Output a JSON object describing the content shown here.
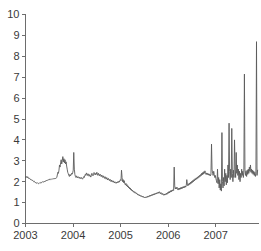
{
  "chart_data": {
    "type": "line",
    "title": "",
    "subtitle": "",
    "xlabel": "",
    "ylabel": "",
    "xlim": [
      2003.0,
      2007.9
    ],
    "ylim": [
      0,
      10
    ],
    "grid": false,
    "legend": null,
    "legend_position": "none",
    "line_color": "#5a5a5a",
    "axis_color": "#6d6d6d",
    "text_color": "#3a3a3a",
    "background": "#ffffff",
    "x_ticks": [
      2003,
      2004,
      2005,
      2006,
      2007
    ],
    "x_tick_labels": [
      "2003",
      "2004",
      "2005",
      "2006",
      "2007"
    ],
    "y_ticks": [
      0,
      1,
      2,
      3,
      4,
      5,
      6,
      7,
      8,
      9,
      10
    ],
    "y_tick_labels": [
      "0",
      "1",
      "2",
      "3",
      "4",
      "5",
      "6",
      "7",
      "8",
      "9",
      "10"
    ],
    "series": [
      {
        "name": "spread",
        "x": [
          2003.0,
          2003.012,
          2003.023,
          2003.035,
          2003.046,
          2003.058,
          2003.069,
          2003.081,
          2003.092,
          2003.104,
          2003.115,
          2003.127,
          2003.138,
          2003.15,
          2003.162,
          2003.173,
          2003.185,
          2003.196,
          2003.208,
          2003.219,
          2003.231,
          2003.242,
          2003.254,
          2003.265,
          2003.277,
          2003.288,
          2003.3,
          2003.312,
          2003.323,
          2003.335,
          2003.346,
          2003.358,
          2003.369,
          2003.381,
          2003.392,
          2003.404,
          2003.415,
          2003.427,
          2003.438,
          2003.45,
          2003.462,
          2003.473,
          2003.485,
          2003.496,
          2003.508,
          2003.519,
          2003.531,
          2003.542,
          2003.554,
          2003.565,
          2003.577,
          2003.588,
          2003.6,
          2003.612,
          2003.623,
          2003.635,
          2003.646,
          2003.658,
          2003.669,
          2003.681,
          2003.692,
          2003.704,
          2003.715,
          2003.727,
          2003.738,
          2003.75,
          2003.762,
          2003.773,
          2003.785,
          2003.796,
          2003.808,
          2003.819,
          2003.831,
          2003.842,
          2003.854,
          2003.865,
          2003.877,
          2003.888,
          2003.9,
          2003.912,
          2003.923,
          2003.935,
          2003.946,
          2003.958,
          2003.969,
          2003.981,
          2003.992,
          2004.004,
          2004.015,
          2004.027,
          2004.038,
          2004.05,
          2004.062,
          2004.073,
          2004.085,
          2004.096,
          2004.108,
          2004.119,
          2004.131,
          2004.142,
          2004.154,
          2004.165,
          2004.177,
          2004.188,
          2004.2,
          2004.212,
          2004.223,
          2004.235,
          2004.246,
          2004.258,
          2004.269,
          2004.281,
          2004.292,
          2004.304,
          2004.315,
          2004.327,
          2004.338,
          2004.35,
          2004.362,
          2004.373,
          2004.385,
          2004.396,
          2004.408,
          2004.419,
          2004.431,
          2004.442,
          2004.454,
          2004.465,
          2004.477,
          2004.488,
          2004.5,
          2004.512,
          2004.523,
          2004.535,
          2004.546,
          2004.558,
          2004.569,
          2004.581,
          2004.592,
          2004.604,
          2004.615,
          2004.627,
          2004.638,
          2004.65,
          2004.662,
          2004.673,
          2004.685,
          2004.696,
          2004.708,
          2004.719,
          2004.731,
          2004.742,
          2004.754,
          2004.765,
          2004.777,
          2004.788,
          2004.8,
          2004.812,
          2004.823,
          2004.835,
          2004.846,
          2004.858,
          2004.869,
          2004.881,
          2004.892,
          2004.904,
          2004.915,
          2004.927,
          2004.938,
          2004.95,
          2004.962,
          2004.973,
          2004.985,
          2004.996,
          2005.008,
          2005.019,
          2005.031,
          2005.042,
          2005.054,
          2005.065,
          2005.077,
          2005.088,
          2005.1,
          2005.112,
          2005.123,
          2005.135,
          2005.146,
          2005.158,
          2005.169,
          2005.181,
          2005.192,
          2005.204,
          2005.215,
          2005.227,
          2005.238,
          2005.25,
          2005.262,
          2005.273,
          2005.285,
          2005.296,
          2005.308,
          2005.319,
          2005.331,
          2005.342,
          2005.354,
          2005.365,
          2005.377,
          2005.388,
          2005.4,
          2005.412,
          2005.423,
          2005.435,
          2005.446,
          2005.458,
          2005.469,
          2005.481,
          2005.492,
          2005.504,
          2005.515,
          2005.527,
          2005.538,
          2005.55,
          2005.562,
          2005.573,
          2005.585,
          2005.596,
          2005.608,
          2005.619,
          2005.631,
          2005.642,
          2005.654,
          2005.665,
          2005.677,
          2005.688,
          2005.7,
          2005.712,
          2005.723,
          2005.735,
          2005.746,
          2005.758,
          2005.769,
          2005.781,
          2005.792,
          2005.804,
          2005.815,
          2005.827,
          2005.838,
          2005.85,
          2005.862,
          2005.873,
          2005.885,
          2005.896,
          2005.908,
          2005.919,
          2005.931,
          2005.942,
          2005.954,
          2005.965,
          2005.977,
          2005.988,
          2006.0,
          2006.012,
          2006.023,
          2006.035,
          2006.046,
          2006.058,
          2006.069,
          2006.081,
          2006.092,
          2006.104,
          2006.115,
          2006.127,
          2006.138,
          2006.15,
          2006.162,
          2006.173,
          2006.185,
          2006.196,
          2006.208,
          2006.219,
          2006.231,
          2006.242,
          2006.254,
          2006.265,
          2006.277,
          2006.288,
          2006.3,
          2006.312,
          2006.323,
          2006.335,
          2006.346,
          2006.358,
          2006.369,
          2006.381,
          2006.392,
          2006.404,
          2006.415,
          2006.427,
          2006.438,
          2006.45,
          2006.462,
          2006.473,
          2006.485,
          2006.496,
          2006.508,
          2006.519,
          2006.531,
          2006.542,
          2006.554,
          2006.565,
          2006.577,
          2006.588,
          2006.6,
          2006.612,
          2006.623,
          2006.635,
          2006.646,
          2006.658,
          2006.669,
          2006.681,
          2006.692,
          2006.704,
          2006.715,
          2006.727,
          2006.738,
          2006.75,
          2006.762,
          2006.773,
          2006.785,
          2006.796,
          2006.808,
          2006.819,
          2006.831,
          2006.842,
          2006.854,
          2006.865,
          2006.877,
          2006.888,
          2006.9,
          2006.912,
          2006.923,
          2006.935,
          2006.946,
          2006.958,
          2006.969,
          2006.981,
          2006.992,
          2007.004,
          2007.015,
          2007.027,
          2007.038,
          2007.05,
          2007.062,
          2007.073,
          2007.085,
          2007.096,
          2007.108,
          2007.119,
          2007.131,
          2007.142,
          2007.154,
          2007.165,
          2007.177,
          2007.188,
          2007.2,
          2007.212,
          2007.223,
          2007.235,
          2007.246,
          2007.258,
          2007.269,
          2007.281,
          2007.292,
          2007.304,
          2007.315,
          2007.327,
          2007.338,
          2007.35,
          2007.362,
          2007.373,
          2007.385,
          2007.396,
          2007.408,
          2007.419,
          2007.431,
          2007.442,
          2007.454,
          2007.465,
          2007.477,
          2007.488,
          2007.5,
          2007.512,
          2007.523,
          2007.535,
          2007.546,
          2007.558,
          2007.569,
          2007.581,
          2007.592,
          2007.604,
          2007.615,
          2007.627,
          2007.638,
          2007.65,
          2007.662,
          2007.673,
          2007.685,
          2007.696,
          2007.708,
          2007.719,
          2007.731,
          2007.742,
          2007.754,
          2007.765,
          2007.777,
          2007.788,
          2007.8,
          2007.812,
          2007.823,
          2007.835,
          2007.846,
          2007.858,
          2007.869,
          2007.881
        ],
        "values": [
          2.2,
          2.26,
          2.22,
          2.18,
          2.24,
          2.2,
          2.15,
          2.18,
          2.14,
          2.1,
          2.12,
          2.08,
          2.05,
          2.07,
          2.03,
          2.0,
          2.02,
          1.98,
          1.95,
          1.97,
          1.93,
          1.92,
          1.95,
          1.93,
          1.9,
          1.92,
          1.95,
          1.93,
          1.97,
          1.95,
          1.98,
          2.0,
          1.97,
          1.99,
          2.02,
          2.0,
          2.04,
          2.02,
          2.06,
          2.05,
          2.08,
          2.06,
          2.1,
          2.08,
          2.12,
          2.1,
          2.13,
          2.11,
          2.14,
          2.12,
          2.15,
          2.13,
          2.16,
          2.14,
          2.17,
          2.15,
          2.18,
          2.2,
          2.32,
          2.45,
          2.4,
          2.55,
          2.8,
          2.7,
          2.9,
          3.05,
          2.85,
          3.0,
          3.2,
          2.95,
          3.1,
          2.9,
          3.05,
          2.85,
          2.95,
          2.75,
          2.6,
          2.45,
          2.38,
          2.3,
          2.25,
          2.35,
          2.28,
          2.32,
          2.4,
          2.36,
          2.42,
          2.55,
          3.4,
          2.6,
          2.35,
          2.25,
          2.2,
          2.28,
          2.22,
          2.18,
          2.24,
          2.2,
          2.16,
          2.22,
          2.18,
          2.14,
          2.2,
          2.16,
          2.12,
          2.18,
          2.24,
          2.2,
          2.28,
          2.35,
          2.3,
          2.42,
          2.36,
          2.3,
          2.38,
          2.32,
          2.26,
          2.34,
          2.28,
          2.22,
          2.3,
          2.4,
          2.34,
          2.28,
          2.36,
          2.44,
          2.38,
          2.32,
          2.4,
          2.35,
          2.45,
          2.38,
          2.3,
          2.4,
          2.34,
          2.28,
          2.36,
          2.3,
          2.24,
          2.32,
          2.26,
          2.2,
          2.28,
          2.22,
          2.16,
          2.24,
          2.18,
          2.12,
          2.2,
          2.14,
          2.08,
          2.16,
          2.1,
          2.05,
          2.12,
          2.06,
          2.0,
          2.08,
          2.02,
          1.98,
          2.04,
          1.98,
          1.94,
          2.0,
          1.96,
          1.92,
          1.98,
          1.94,
          2.0,
          1.96,
          2.02,
          1.98,
          2.05,
          2.1,
          2.05,
          2.55,
          2.2,
          2.0,
          2.1,
          1.95,
          2.05,
          1.9,
          1.85,
          1.92,
          1.8,
          1.86,
          1.75,
          1.8,
          1.7,
          1.74,
          1.65,
          1.7,
          1.6,
          1.64,
          1.56,
          1.6,
          1.52,
          1.55,
          1.48,
          1.52,
          1.45,
          1.48,
          1.42,
          1.45,
          1.38,
          1.41,
          1.35,
          1.38,
          1.32,
          1.35,
          1.3,
          1.33,
          1.28,
          1.31,
          1.26,
          1.29,
          1.24,
          1.27,
          1.22,
          1.25,
          1.28,
          1.24,
          1.3,
          1.26,
          1.32,
          1.28,
          1.34,
          1.3,
          1.36,
          1.32,
          1.38,
          1.34,
          1.4,
          1.36,
          1.42,
          1.38,
          1.44,
          1.4,
          1.46,
          1.42,
          1.48,
          1.44,
          1.5,
          1.45,
          1.52,
          1.47,
          1.42,
          1.48,
          1.43,
          1.38,
          1.44,
          1.4,
          1.35,
          1.41,
          1.36,
          1.42,
          1.38,
          1.45,
          1.4,
          1.48,
          1.44,
          1.52,
          1.46,
          1.54,
          1.5,
          1.58,
          1.52,
          1.6,
          1.55,
          1.62,
          1.58,
          2.7,
          1.8,
          1.65,
          1.72,
          1.66,
          1.74,
          1.68,
          1.6,
          1.68,
          1.62,
          1.7,
          1.64,
          1.72,
          1.66,
          1.74,
          1.68,
          1.76,
          1.7,
          1.78,
          1.72,
          1.8,
          1.74,
          1.82,
          2.1,
          1.88,
          1.8,
          1.9,
          1.84,
          1.94,
          1.88,
          1.98,
          1.92,
          2.02,
          1.96,
          2.06,
          2.0,
          2.1,
          2.04,
          2.14,
          2.08,
          2.18,
          2.12,
          2.22,
          2.16,
          2.26,
          2.2,
          2.3,
          2.24,
          2.34,
          2.28,
          2.4,
          2.32,
          2.44,
          2.36,
          2.48,
          2.4,
          2.52,
          2.44,
          2.35,
          2.42,
          2.34,
          2.4,
          2.32,
          2.38,
          2.3,
          2.36,
          2.28,
          2.34,
          3.8,
          2.6,
          2.4,
          2.3,
          2.5,
          2.35,
          2.2,
          2.3,
          2.15,
          2.05,
          1.95,
          2.6,
          1.9,
          2.2,
          1.7,
          2.1,
          1.6,
          1.9,
          1.55,
          4.35,
          2.0,
          1.7,
          2.2,
          1.8,
          2.6,
          2.0,
          2.4,
          1.85,
          2.3,
          1.95,
          2.8,
          2.2,
          4.8,
          2.5,
          2.1,
          2.6,
          2.2,
          4.55,
          2.4,
          2.0,
          2.55,
          2.2,
          4.0,
          2.6,
          2.2,
          3.4,
          2.4,
          2.8,
          2.3,
          2.6,
          2.1,
          2.5,
          2.0,
          2.4,
          2.2,
          2.6,
          2.3,
          2.5,
          2.2,
          2.45,
          7.15,
          2.6,
          2.3,
          2.5,
          2.25,
          2.55,
          2.35,
          2.6,
          2.4,
          2.7,
          2.5,
          2.8,
          2.45,
          2.6,
          2.4,
          2.55,
          2.35,
          2.5,
          2.3,
          2.45,
          2.25,
          2.4,
          8.7,
          2.3,
          2.55
        ]
      }
    ]
  }
}
